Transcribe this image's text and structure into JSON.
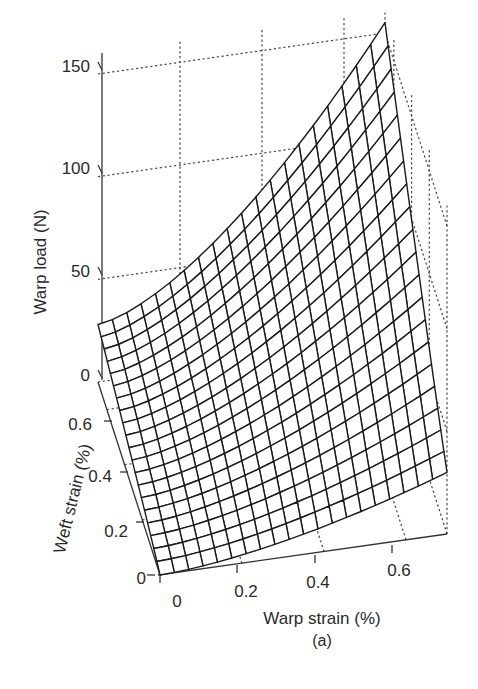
{
  "figure": {
    "caption": "(a)"
  },
  "chart_data": {
    "type": "surface",
    "title": "",
    "caption": "(a)",
    "xlabel": "Warp strain (%)",
    "ylabel": "Weft strain (%)",
    "zlabel": "Warp load (N)",
    "x_ticks": [
      "0",
      "0.2",
      "0.4",
      "0.6"
    ],
    "y_ticks": [
      "0",
      "0.2",
      "0.4",
      "0.6"
    ],
    "z_ticks": [
      "0",
      "50",
      "100",
      "150"
    ],
    "xlim": [
      0,
      0.7
    ],
    "ylim": [
      0,
      0.7
    ],
    "zlim": [
      0,
      150
    ],
    "grid": true,
    "grid_style": "dotted",
    "mesh_resolution": 20,
    "corner_values": [
      {
        "warp_strain": 0.0,
        "weft_strain": 0.0,
        "warp_load": 0
      },
      {
        "warp_strain": 0.7,
        "weft_strain": 0.0,
        "warp_load": 30
      },
      {
        "warp_strain": 0.0,
        "weft_strain": 0.7,
        "warp_load": 28
      },
      {
        "warp_strain": 0.7,
        "weft_strain": 0.7,
        "warp_load": 155
      }
    ]
  },
  "axes": {
    "z": {
      "title": "Warp load (N)",
      "ticks": [
        {
          "label": "150",
          "value": 150
        },
        {
          "label": "100",
          "value": 100
        },
        {
          "label": "50",
          "value": 50
        },
        {
          "label": "0",
          "value": 0
        }
      ]
    },
    "weft": {
      "title": "Weft strain (%)",
      "ticks": [
        {
          "label": "0.6",
          "value": 0.6
        },
        {
          "label": "0.4",
          "value": 0.4
        },
        {
          "label": "0.2",
          "value": 0.2
        },
        {
          "label": "0",
          "value": 0
        }
      ]
    },
    "warp": {
      "title": "Warp strain (%)",
      "ticks": [
        {
          "label": "0",
          "value": 0
        },
        {
          "label": "0.2",
          "value": 0.2
        },
        {
          "label": "0.4",
          "value": 0.4
        },
        {
          "label": "0.6",
          "value": 0.6
        }
      ]
    }
  }
}
